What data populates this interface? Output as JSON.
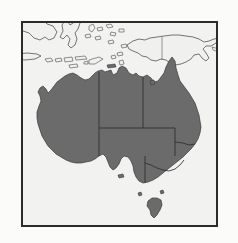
{
  "figure": {
    "width": 238,
    "height": 243
  },
  "frame": {
    "name": "map-border",
    "x": 21,
    "y": 21,
    "width": 197,
    "height": 206,
    "stroke_color": "#2b2b2b",
    "stroke_width": 2
  },
  "colors": {
    "page_background": "#fbfbfa",
    "map_background": "#f2f2f0",
    "highlight_land": "#6b6b6b",
    "highlight_outline": "#3a3a3a",
    "other_land": "#f0f0ee",
    "other_land_outline": "#4a4a4a",
    "state_border": "#2e2e2e",
    "international_border": "#6a6a6a"
  },
  "map": {
    "projection_note": "equirectangular",
    "lon_range": [
      108,
      156
    ],
    "lat_range": [
      -45,
      -2
    ],
    "highlighted_country": "Australia",
    "shaded_regions": [
      "Western Australia",
      "Northern Territory",
      "South Australia",
      "Queensland",
      "New South Wales",
      "Victoria",
      "Tasmania",
      "Australian Capital Territory"
    ],
    "unshaded_regions": [
      "Indonesia",
      "Papua New Guinea",
      "Timor-Leste"
    ],
    "internal_boundaries_shown": true,
    "labels_shown": false,
    "graticule_shown": false
  }
}
